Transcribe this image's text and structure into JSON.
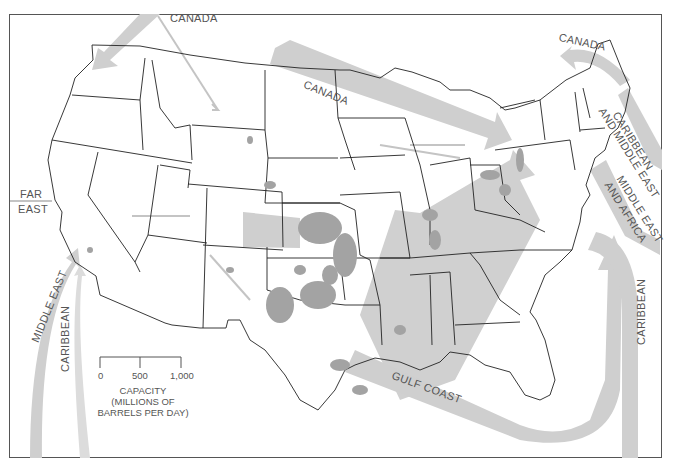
{
  "map": {
    "subject": "U.S. petroleum refining capacity and crude oil import flows",
    "colors": {
      "flow_band": "#c8c8c8",
      "production_area": "#9a9a9a",
      "state_border": "#222222",
      "frame": "#555555"
    },
    "flow_labels": {
      "canada_north": "CANADA",
      "canada_central": "CANADA",
      "canada_northeast": "CANADA",
      "caribbean_middle_east_1": "CARIBBEAN",
      "caribbean_middle_east_2": "AND MIDDLE EAST",
      "middle_east_africa_1": "MIDDLE EAST",
      "middle_east_africa_2": "AND AFRICA",
      "caribbean_east": "CARIBBEAN",
      "gulf_coast": "GULF COAST",
      "far_east_1": "FAR",
      "far_east_2": "EAST",
      "middle_east_west": "MIDDLE EAST",
      "caribbean_west": "CARIBBEAN"
    },
    "legend": {
      "ticks": [
        "0",
        "500",
        "1,000"
      ],
      "title": "CAPACITY",
      "subtitle_1": "(MILLIONS OF",
      "subtitle_2": "BARRELS PER DAY)"
    }
  }
}
